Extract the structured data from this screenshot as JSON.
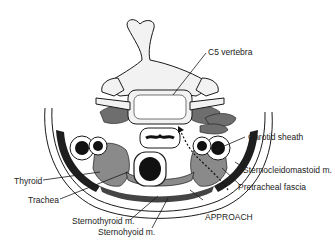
{
  "figure": {
    "labels": {
      "c5_vertebra": "C5 vertebra",
      "carotid_sheath": "Carotid sheath",
      "sternocleidomastoid": "Sternocleidomastoid m.",
      "pretracheal_fascia": "Pretracheal fascia",
      "approach": "APPROACH",
      "thyroid": "Thyroid",
      "trachea": "Trachea",
      "sternothyroid": "Sternothyroid m.",
      "sternohyoid": "Sternohyoid m."
    },
    "colors": {
      "background": "#ffffff",
      "outline": "#1a1a1a",
      "bone": "#f2f2f2",
      "muscle": "#6e6e6e",
      "dark_muscle": "#1e1e1e",
      "vessel": "#111111"
    }
  }
}
